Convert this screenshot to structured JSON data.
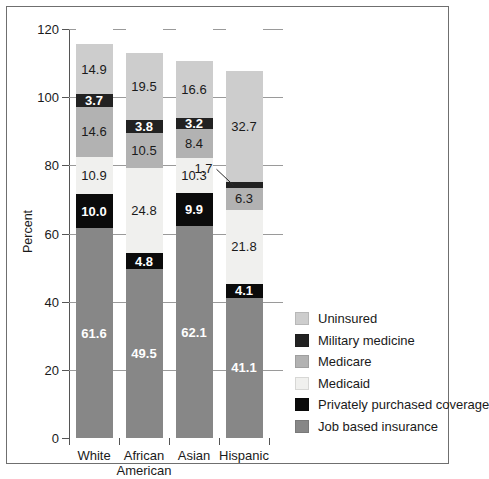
{
  "chart_data": {
    "type": "bar",
    "subtype": "stacked-bar",
    "title": "",
    "xlabel": "",
    "ylabel": "Percent",
    "ylim": [
      0,
      120
    ],
    "yticks": [
      0,
      20,
      40,
      60,
      80,
      100,
      120
    ],
    "grid": true,
    "legend_position": "right",
    "categories": [
      "White",
      "African American",
      "Asian",
      "Hispanic"
    ],
    "category_lines": [
      [
        "White"
      ],
      [
        "African",
        "American"
      ],
      [
        "Asian"
      ],
      [
        "Hispanic"
      ]
    ],
    "series": [
      {
        "name": "Job based insurance",
        "color": "#878787",
        "label_color": "#ffffff",
        "bold": true,
        "values": [
          61.6,
          49.5,
          62.1,
          41.1
        ]
      },
      {
        "name": "Privately purchased coverage",
        "color": "#0b0b0b",
        "label_color": "#ffffff",
        "bold": true,
        "values": [
          10.0,
          4.8,
          9.9,
          4.1
        ]
      },
      {
        "name": "Medicaid",
        "color": "#f0f0ee",
        "label_color": "#1a1a1a",
        "bold": false,
        "values": [
          10.9,
          24.8,
          10.3,
          21.8
        ]
      },
      {
        "name": "Medicare",
        "color": "#b2b2b2",
        "label_color": "#1a1a1a",
        "bold": false,
        "values": [
          14.6,
          10.5,
          8.4,
          6.3
        ]
      },
      {
        "name": "Military medicine",
        "color": "#222222",
        "label_color": "#ffffff",
        "bold": true,
        "values": [
          3.7,
          3.8,
          3.2,
          1.7
        ]
      },
      {
        "name": "Uninsured",
        "color": "#cdcdcd",
        "label_color": "#1a1a1a",
        "bold": false,
        "values": [
          14.9,
          19.5,
          16.6,
          32.7
        ]
      }
    ],
    "totals": [
      115.7,
      112.9,
      110.5,
      107.7
    ],
    "annotations": [
      {
        "text": "1.7",
        "series": "Military medicine",
        "category": "Hispanic",
        "kind": "leader-line-callout"
      }
    ]
  },
  "legend": {
    "items": [
      {
        "label": "Uninsured",
        "color": "#cdcdcd"
      },
      {
        "label": "Military medicine",
        "color": "#222222"
      },
      {
        "label": "Medicare",
        "color": "#b2b2b2"
      },
      {
        "label": "Medicaid",
        "color": "#f0f0ee"
      },
      {
        "label": "Privately purchased coverage",
        "color": "#0b0b0b"
      },
      {
        "label": "Job based insurance",
        "color": "#878787"
      }
    ]
  },
  "axis": {
    "y_label": "Percent",
    "y_tick_labels": [
      "0",
      "20",
      "40",
      "60",
      "80",
      "100",
      "120"
    ]
  }
}
